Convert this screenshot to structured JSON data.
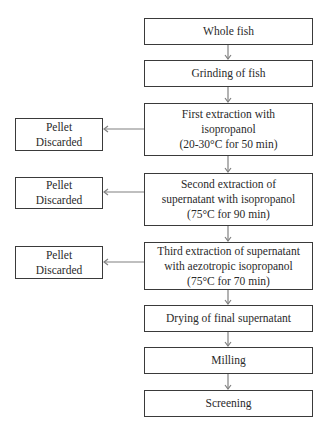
{
  "diagram": {
    "type": "flowchart",
    "main_steps": [
      {
        "id": "whole-fish",
        "lines": [
          "Whole fish"
        ]
      },
      {
        "id": "grinding",
        "lines": [
          "Grinding of fish"
        ]
      },
      {
        "id": "first-extraction",
        "lines": [
          "First extraction with",
          "isopropanol",
          "(20-30°C for 50 min)"
        ]
      },
      {
        "id": "second-extraction",
        "lines": [
          "Second extraction of",
          "supernatant with isopropanol",
          "(75°C for 90 min)"
        ]
      },
      {
        "id": "third-extraction",
        "lines": [
          "Third extraction of supernatant",
          "with aezotropic isopropanol",
          "(75°C for 70 min)"
        ]
      },
      {
        "id": "drying",
        "lines": [
          "Drying of final supernatant"
        ]
      },
      {
        "id": "milling",
        "lines": [
          "Milling"
        ]
      },
      {
        "id": "screening",
        "lines": [
          "Screening"
        ]
      }
    ],
    "side_outputs": [
      {
        "from": "first-extraction",
        "lines": [
          "Pellet",
          "Discarded"
        ]
      },
      {
        "from": "second-extraction",
        "lines": [
          "Pellet",
          "Discarded"
        ]
      },
      {
        "from": "third-extraction",
        "lines": [
          "Pellet",
          "Discarded"
        ]
      }
    ],
    "colors": {
      "stroke": "#3a3a3a",
      "arrow": "#808080",
      "text": "#2a2a2a",
      "background": "#ffffff"
    }
  }
}
